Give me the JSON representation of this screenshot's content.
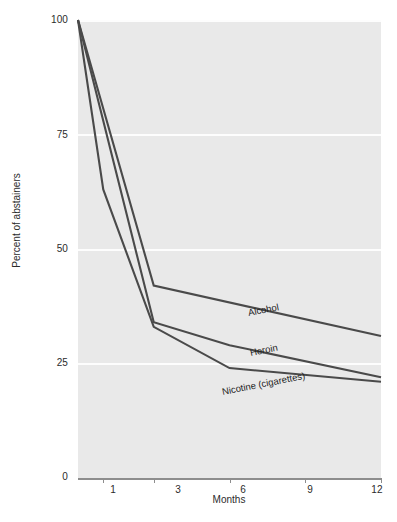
{
  "chart_data": {
    "type": "line",
    "title": "",
    "subtitle": "",
    "xlabel": "Months",
    "ylabel": "Percent of abstainers",
    "xlim": [
      0,
      12
    ],
    "ylim": [
      0,
      100
    ],
    "x_ticks": [
      1,
      3,
      6,
      9,
      12
    ],
    "x_tick_labels": [
      "1",
      "3",
      "6",
      "9",
      "12"
    ],
    "y_ticks": [
      0,
      25,
      50,
      75,
      100
    ],
    "y_tick_labels": [
      "0",
      "25",
      "50",
      "75",
      "100"
    ],
    "grid": "horizontal",
    "legend_position": "inline-series-labels",
    "series": [
      {
        "name": "Alcohol",
        "x": [
          0,
          3,
          12
        ],
        "values": [
          100,
          42,
          31
        ]
      },
      {
        "name": "Heroin",
        "x": [
          0,
          3,
          6,
          12
        ],
        "values": [
          100,
          34,
          29,
          22
        ]
      },
      {
        "name": "Nicotine (cigarettes)",
        "x": [
          0,
          1,
          3,
          6,
          12
        ],
        "values": [
          100,
          63,
          33,
          24,
          21
        ]
      }
    ],
    "colors": {
      "line": "#4a4a4a",
      "panel_background": "#e9e9e9",
      "gridline": "#fdfdfd",
      "axis": "#8d8d8d",
      "text": "#2b2b2b"
    }
  },
  "axes": {
    "y_label": "Percent of abstainers",
    "x_label": "Months",
    "y_tick_labels": [
      "100",
      "75",
      "50",
      "25",
      "0"
    ],
    "x_tick_labels": [
      "1",
      "3",
      "6",
      "9",
      "12"
    ]
  },
  "series_labels": {
    "alcohol": "Alcohol",
    "heroin": "Heroin",
    "nicotine": "Nicotine (cigarettes)"
  }
}
